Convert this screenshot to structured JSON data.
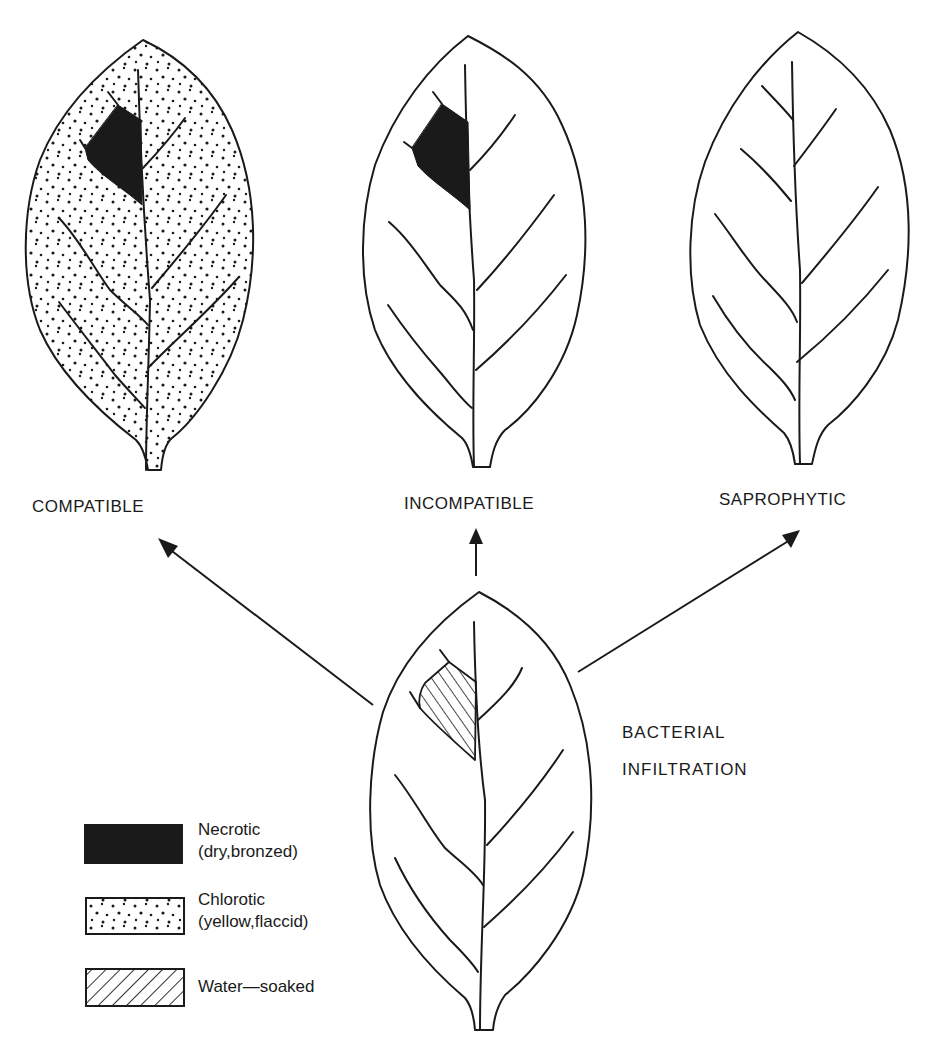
{
  "figure": {
    "outcomes": [
      {
        "id": "compatible",
        "label": "COMPATIBLE",
        "symptoms": [
          "necrotic",
          "chlorotic"
        ]
      },
      {
        "id": "incompatible",
        "label": "INCOMPATIBLE",
        "symptoms": [
          "necrotic"
        ]
      },
      {
        "id": "saprophytic",
        "label": "SAPROPHYTIC",
        "symptoms": []
      }
    ],
    "origin": {
      "label_line1": "BACTERIAL",
      "label_line2": "INFILTRATION",
      "symptoms": [
        "water-soaked"
      ]
    },
    "legend": [
      {
        "id": "necrotic",
        "line1": "Necrotic",
        "line2": "(dry,bronzed)",
        "swatch": "solid-black"
      },
      {
        "id": "chlorotic",
        "line1": "Chlorotic",
        "line2": "(yellow,flaccid)",
        "swatch": "stippled"
      },
      {
        "id": "water-soaked",
        "line1": "Water—soaked",
        "line2": "",
        "swatch": "hatched"
      }
    ],
    "colors": {
      "ink": "#1a1a1a",
      "background": "#ffffff"
    }
  }
}
